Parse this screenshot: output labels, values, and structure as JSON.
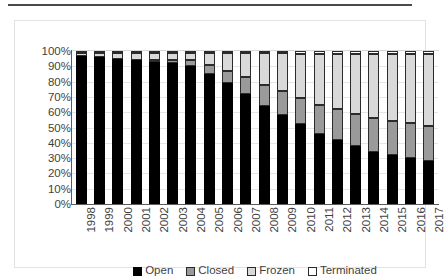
{
  "chart_data": {
    "type": "bar",
    "stacked": true,
    "stack_mode": "percent",
    "title": "",
    "subtitle": "",
    "xlabel": "",
    "ylabel": "",
    "ylim": [
      0,
      100
    ],
    "ytick_labels": [
      "100%",
      "90%",
      "80%",
      "70%",
      "60%",
      "50%",
      "40%",
      "30%",
      "20%",
      "10%",
      "0%"
    ],
    "ytick_values": [
      100,
      90,
      80,
      70,
      60,
      50,
      40,
      30,
      20,
      10,
      0
    ],
    "grid": true,
    "legend_position": "bottom",
    "categories": [
      "1998",
      "1999",
      "2000",
      "2001",
      "2002",
      "2003",
      "2004",
      "2005",
      "2006",
      "2007",
      "2008",
      "2009",
      "2010",
      "2011",
      "2012",
      "2013",
      "2014",
      "2015",
      "2016",
      "2017"
    ],
    "series": [
      {
        "name": "Open",
        "color": "#000000",
        "values": [
          97,
          96,
          95,
          94,
          93,
          92,
          90,
          85,
          79,
          72,
          64,
          58,
          52,
          46,
          42,
          38,
          34,
          32,
          30,
          28
        ]
      },
      {
        "name": "Closed",
        "color": "#9a9a9a",
        "values": [
          0,
          0,
          0,
          0,
          1,
          2,
          4,
          6,
          8,
          11,
          14,
          16,
          17,
          19,
          20,
          21,
          22,
          22,
          23,
          23
        ]
      },
      {
        "name": "Frozen",
        "color": "#d9d9d9",
        "values": [
          2,
          3,
          4,
          5,
          5,
          5,
          5,
          8,
          12,
          16,
          21,
          25,
          29,
          33,
          36,
          39,
          42,
          44,
          45,
          47
        ]
      },
      {
        "name": "Terminated",
        "color": "#ffffff",
        "values": [
          1,
          1,
          1,
          1,
          1,
          1,
          1,
          1,
          1,
          1,
          1,
          1,
          2,
          2,
          2,
          2,
          2,
          2,
          2,
          2
        ]
      }
    ]
  },
  "legend": {
    "items": [
      {
        "label": "Open",
        "swatch": "open-swatch"
      },
      {
        "label": "Closed",
        "swatch": "closed-swatch"
      },
      {
        "label": "Frozen",
        "swatch": "frozen-swatch"
      },
      {
        "label": "Terminated",
        "swatch": "terminated-swatch"
      }
    ]
  }
}
